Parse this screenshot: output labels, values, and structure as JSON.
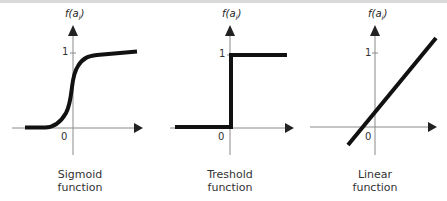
{
  "panels": [
    {
      "id": "sigmoid",
      "y_axis_label": "f(a",
      "y_axis_sub": "i",
      "y_axis_close": ")",
      "tick_one": "1",
      "tick_zero": "0",
      "caption_line1": "Sigmoid",
      "caption_line2": "function"
    },
    {
      "id": "threshold",
      "y_axis_label": "f(a",
      "y_axis_sub": "i",
      "y_axis_close": ")",
      "tick_one": "1",
      "tick_zero": "0",
      "caption_line1": "Treshold",
      "caption_line2": "function"
    },
    {
      "id": "linear",
      "y_axis_label": "f(a",
      "y_axis_sub": "i",
      "y_axis_close": ")",
      "tick_one": "1",
      "tick_zero": "0",
      "caption_line1": "Linear",
      "caption_line2": "function"
    }
  ],
  "colors": {
    "curve": "#111111",
    "axis": "#8a8a8a",
    "arrow": "#222222",
    "text": "#333333"
  }
}
